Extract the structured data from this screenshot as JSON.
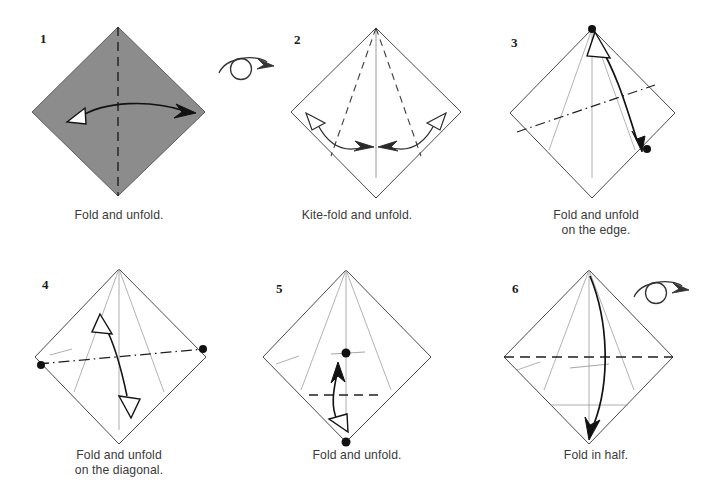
{
  "figure": {
    "background_color": "#ffffff",
    "paper_shaded_color": "#8c8c8c",
    "paper_white_color": "#ffffff",
    "edge_color": "#3a3a3a",
    "crease_color": "#9a9a9a",
    "arrow_color": "#1a1a1a",
    "dot_color": "#111111",
    "caption_color": "#3a3a3a"
  },
  "steps": [
    {
      "number": "1",
      "caption_line1": "Fold and unfold.",
      "caption_line2": "",
      "paper": "shaded",
      "turn_over_symbol": true,
      "icons": [
        "valley-fold-dashed-line",
        "double-arrow-fold-unfold",
        "turn-over-symbol"
      ]
    },
    {
      "number": "2",
      "caption_line1": "Kite-fold and unfold.",
      "caption_line2": "",
      "paper": "white",
      "turn_over_symbol": false,
      "icons": [
        "kite-dashed-creases",
        "double-arrow-left",
        "double-arrow-right"
      ]
    },
    {
      "number": "3",
      "caption_line1": "Fold and unfold",
      "caption_line2": "on the edge.",
      "paper": "white",
      "turn_over_symbol": false,
      "icons": [
        "dash-dot-crease-line",
        "reference-dot-top",
        "reference-dot-right",
        "curved-double-arrow"
      ]
    },
    {
      "number": "4",
      "caption_line1": "Fold and unfold",
      "caption_line2": "on the diagonal.",
      "paper": "white",
      "turn_over_symbol": false,
      "icons": [
        "dash-dot-crease-line",
        "reference-dot-left",
        "reference-dot-right",
        "curved-double-arrow"
      ]
    },
    {
      "number": "5",
      "caption_line1": "Fold and unfold.",
      "caption_line2": "",
      "paper": "white",
      "turn_over_symbol": false,
      "icons": [
        "horizontal-dashed-crease",
        "reference-dot-center",
        "reference-dot-bottom",
        "curved-double-arrow"
      ]
    },
    {
      "number": "6",
      "caption_line1": "Fold in half.",
      "caption_line2": "",
      "paper": "white",
      "turn_over_symbol": true,
      "icons": [
        "horizontal-dashed-crease",
        "curved-fold-arrow",
        "turn-over-symbol"
      ]
    }
  ]
}
